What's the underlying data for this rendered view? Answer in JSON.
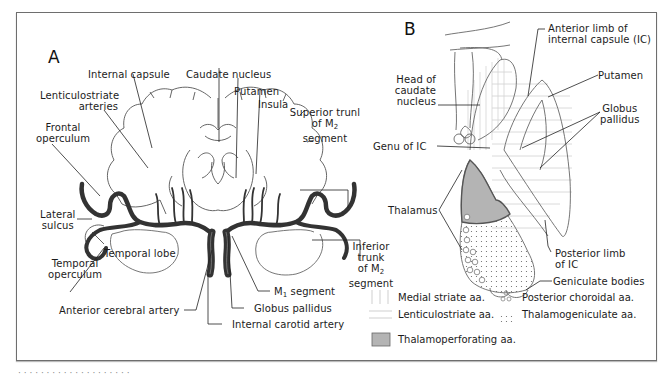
{
  "figure": {
    "panel_a": {
      "letter": "A",
      "labels": {
        "internal_capsule": "Internal capsule",
        "caudate_nucleus": "Caudate nucleus",
        "putamen": "Putamen",
        "insula": "Insula",
        "lenticulostriate_1": "Lenticulostriate",
        "lenticulostriate_2": "arteries",
        "frontal_1": "Frontal",
        "frontal_2": "operculum",
        "superior_1": "Superior trunl",
        "superior_2": "of M",
        "superior_2_sub": "2",
        "superior_3": "segment",
        "lateral_1": "Lateral",
        "lateral_2": "sulcus",
        "temporal_lobe": "Temporal lobe",
        "temporal_op_1": "Temporal",
        "temporal_op_2": "operculum",
        "inferior_1": "Inferior",
        "inferior_2": "trunk",
        "inferior_3": "of M",
        "inferior_3_sub": "2",
        "inferior_4": "segment",
        "m1_prefix": "M",
        "m1_sub": "1",
        "m1_suffix": " segment",
        "globus_pallidus": "Globus pallidus",
        "anterior_cerebral": "Anterior cerebral artery",
        "internal_carotid": "Internal carotid artery"
      }
    },
    "panel_b": {
      "letter": "B",
      "labels": {
        "anterior_limb_1": "Anterior limb of",
        "anterior_limb_2": "internal capsule (IC)",
        "head_caudate_1": "Head of",
        "head_caudate_2": "caudate",
        "head_caudate_3": "nucleus",
        "putamen": "Putamen",
        "globus_1": "Globus",
        "globus_2": "pallidus",
        "genu": "Genu of IC",
        "thalamus": "Thalamus",
        "posterior_limb_1": "Posterior limb",
        "posterior_limb_2": "of IC",
        "geniculate": "Geniculate bodies"
      },
      "legend": [
        {
          "pattern": "vertical-lines",
          "label": "Medial striate aa."
        },
        {
          "pattern": "horizontal-lines",
          "label": "Lenticulostriate aa."
        },
        {
          "pattern": "gray-fill",
          "label": "Thalamoperforating aa.",
          "color": "#b4b4b4"
        },
        {
          "pattern": "circles",
          "label": "Posterior choroidal aa."
        },
        {
          "pattern": "dots",
          "label": "Thalamogeniculate aa."
        }
      ]
    },
    "caption": "· · · ·  ·  · ·  · ·  ·  · ·  ·  ·   · ·  · ·  · ·"
  },
  "colors": {
    "artery": "#3a3a3a",
    "outline": "#555555",
    "thalamoperforating": "#b4b4b4",
    "hatch": "#c8c8c8",
    "frame": "#6e6e6e"
  }
}
